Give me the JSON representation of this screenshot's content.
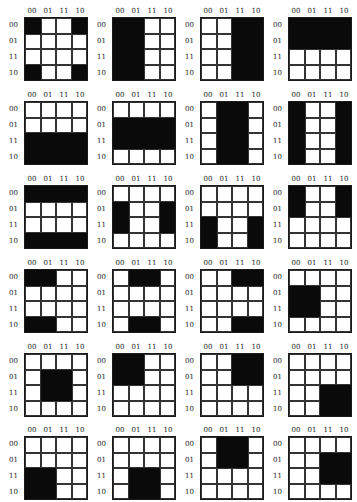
{
  "column_labels": [
    "00",
    "01",
    "11",
    "10"
  ],
  "row_labels": [
    "00",
    "01",
    "11",
    "10"
  ],
  "colors": {
    "filled": "#0a0a0a",
    "empty": "#ffffff",
    "grid": "#1a1a1a"
  },
  "layout": {
    "columns": 4,
    "rows": 6
  },
  "maps": [
    {
      "id": 1,
      "filled": [
        [
          1,
          0,
          0,
          1
        ],
        [
          0,
          0,
          0,
          0
        ],
        [
          0,
          0,
          0,
          0
        ],
        [
          1,
          0,
          0,
          1
        ]
      ]
    },
    {
      "id": 2,
      "filled": [
        [
          1,
          1,
          0,
          0
        ],
        [
          1,
          1,
          0,
          0
        ],
        [
          1,
          1,
          0,
          0
        ],
        [
          1,
          1,
          0,
          0
        ]
      ]
    },
    {
      "id": 3,
      "filled": [
        [
          0,
          0,
          1,
          1
        ],
        [
          0,
          0,
          1,
          1
        ],
        [
          0,
          0,
          1,
          1
        ],
        [
          0,
          0,
          1,
          1
        ]
      ]
    },
    {
      "id": 4,
      "filled": [
        [
          1,
          1,
          1,
          1
        ],
        [
          1,
          1,
          1,
          1
        ],
        [
          0,
          0,
          0,
          0
        ],
        [
          0,
          0,
          0,
          0
        ]
      ]
    },
    {
      "id": 5,
      "filled": [
        [
          0,
          0,
          0,
          0
        ],
        [
          0,
          0,
          0,
          0
        ],
        [
          1,
          1,
          1,
          1
        ],
        [
          1,
          1,
          1,
          1
        ]
      ]
    },
    {
      "id": 6,
      "filled": [
        [
          0,
          0,
          0,
          0
        ],
        [
          1,
          1,
          1,
          1
        ],
        [
          1,
          1,
          1,
          1
        ],
        [
          0,
          0,
          0,
          0
        ]
      ]
    },
    {
      "id": 7,
      "filled": [
        [
          0,
          1,
          1,
          0
        ],
        [
          0,
          1,
          1,
          0
        ],
        [
          0,
          1,
          1,
          0
        ],
        [
          0,
          1,
          1,
          0
        ]
      ]
    },
    {
      "id": 8,
      "filled": [
        [
          1,
          0,
          0,
          1
        ],
        [
          1,
          0,
          0,
          1
        ],
        [
          1,
          0,
          0,
          1
        ],
        [
          1,
          0,
          0,
          1
        ]
      ]
    },
    {
      "id": 9,
      "filled": [
        [
          1,
          1,
          1,
          1
        ],
        [
          0,
          0,
          0,
          0
        ],
        [
          0,
          0,
          0,
          0
        ],
        [
          1,
          1,
          1,
          1
        ]
      ]
    },
    {
      "id": 10,
      "filled": [
        [
          0,
          0,
          0,
          0
        ],
        [
          1,
          0,
          0,
          1
        ],
        [
          1,
          0,
          0,
          1
        ],
        [
          0,
          0,
          0,
          0
        ]
      ]
    },
    {
      "id": 11,
      "filled": [
        [
          0,
          0,
          0,
          0
        ],
        [
          0,
          0,
          0,
          0
        ],
        [
          1,
          0,
          0,
          1
        ],
        [
          1,
          0,
          0,
          1
        ]
      ]
    },
    {
      "id": 12,
      "filled": [
        [
          1,
          0,
          0,
          1
        ],
        [
          1,
          0,
          0,
          1
        ],
        [
          0,
          0,
          0,
          0
        ],
        [
          0,
          0,
          0,
          0
        ]
      ]
    },
    {
      "id": 13,
      "filled": [
        [
          1,
          1,
          0,
          0
        ],
        [
          0,
          0,
          0,
          0
        ],
        [
          0,
          0,
          0,
          0
        ],
        [
          1,
          1,
          0,
          0
        ]
      ]
    },
    {
      "id": 14,
      "filled": [
        [
          0,
          1,
          1,
          0
        ],
        [
          0,
          0,
          0,
          0
        ],
        [
          0,
          0,
          0,
          0
        ],
        [
          0,
          1,
          1,
          0
        ]
      ]
    },
    {
      "id": 15,
      "filled": [
        [
          0,
          0,
          1,
          1
        ],
        [
          0,
          0,
          0,
          0
        ],
        [
          0,
          0,
          0,
          0
        ],
        [
          0,
          0,
          1,
          1
        ]
      ]
    },
    {
      "id": 16,
      "filled": [
        [
          0,
          0,
          0,
          0
        ],
        [
          1,
          1,
          0,
          0
        ],
        [
          1,
          1,
          0,
          0
        ],
        [
          0,
          0,
          0,
          0
        ]
      ]
    },
    {
      "id": 17,
      "filled": [
        [
          0,
          0,
          0,
          0
        ],
        [
          0,
          1,
          1,
          0
        ],
        [
          0,
          1,
          1,
          0
        ],
        [
          0,
          0,
          0,
          0
        ]
      ]
    },
    {
      "id": 18,
      "filled": [
        [
          1,
          1,
          0,
          0
        ],
        [
          1,
          1,
          0,
          0
        ],
        [
          0,
          0,
          0,
          0
        ],
        [
          0,
          0,
          0,
          0
        ]
      ]
    },
    {
      "id": 19,
      "filled": [
        [
          0,
          0,
          1,
          1
        ],
        [
          0,
          0,
          1,
          1
        ],
        [
          0,
          0,
          0,
          0
        ],
        [
          0,
          0,
          0,
          0
        ]
      ]
    },
    {
      "id": 20,
      "filled": [
        [
          0,
          0,
          0,
          0
        ],
        [
          0,
          0,
          0,
          0
        ],
        [
          0,
          0,
          1,
          1
        ],
        [
          0,
          0,
          1,
          1
        ]
      ]
    },
    {
      "id": 21,
      "filled": [
        [
          0,
          0,
          0,
          0
        ],
        [
          0,
          0,
          0,
          0
        ],
        [
          1,
          1,
          0,
          0
        ],
        [
          1,
          1,
          0,
          0
        ]
      ]
    },
    {
      "id": 22,
      "filled": [
        [
          0,
          0,
          0,
          0
        ],
        [
          0,
          0,
          0,
          0
        ],
        [
          0,
          1,
          1,
          0
        ],
        [
          0,
          1,
          1,
          0
        ]
      ]
    },
    {
      "id": 23,
      "filled": [
        [
          0,
          1,
          1,
          0
        ],
        [
          0,
          1,
          1,
          0
        ],
        [
          0,
          0,
          0,
          0
        ],
        [
          0,
          0,
          0,
          0
        ]
      ]
    },
    {
      "id": 24,
      "filled": [
        [
          0,
          0,
          0,
          0
        ],
        [
          0,
          0,
          1,
          1
        ],
        [
          0,
          0,
          1,
          1
        ],
        [
          0,
          0,
          0,
          0
        ]
      ]
    }
  ]
}
